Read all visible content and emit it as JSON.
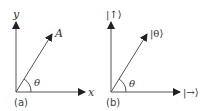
{
  "colors": {
    "line": "#555555",
    "text": "#333333",
    "background": "#ffffff"
  },
  "panel_a": {
    "caption": "(a)",
    "y_axis_label": "y",
    "x_axis_label": "x",
    "vector_label": "A",
    "angle_label": "θ"
  },
  "panel_b": {
    "caption": "(b)",
    "vertical_axis_label": "|↑⟩",
    "horizontal_axis_label": "|→⟩",
    "vector_label": "|θ⟩",
    "angle_label": "θ"
  }
}
